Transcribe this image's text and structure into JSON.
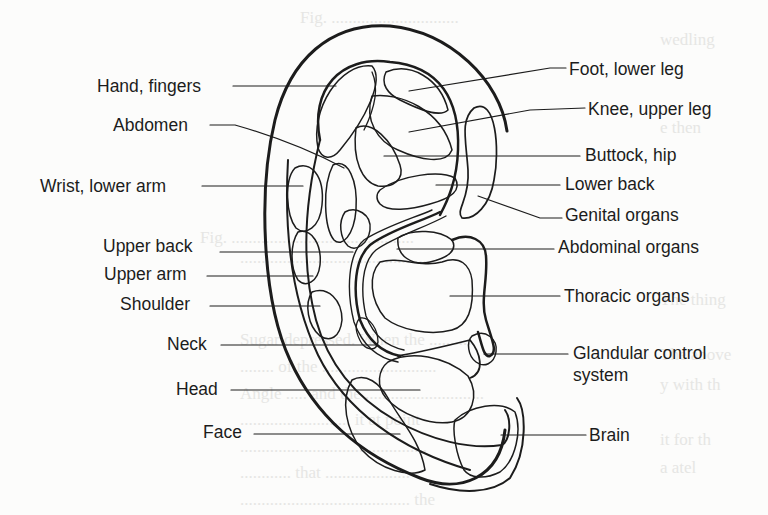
{
  "figure": {
    "type": "auricular-map"
  },
  "labels_left": [
    {
      "id": "hand-fingers",
      "text": "Hand, fingers",
      "x": 97,
      "y": 77
    },
    {
      "id": "abdomen",
      "text": "Abdomen",
      "x": 113,
      "y": 115
    },
    {
      "id": "wrist-lower-arm",
      "text": "Wrist, lower arm",
      "x": 40,
      "y": 176
    },
    {
      "id": "upper-back",
      "text": "Upper back",
      "x": 103,
      "y": 236
    },
    {
      "id": "upper-arm",
      "text": "Upper arm",
      "x": 104,
      "y": 264
    },
    {
      "id": "shoulder",
      "text": "Shoulder",
      "x": 120,
      "y": 294
    },
    {
      "id": "neck",
      "text": "Neck",
      "x": 167,
      "y": 334
    },
    {
      "id": "head",
      "text": "Head",
      "x": 176,
      "y": 379
    },
    {
      "id": "face",
      "text": "Face",
      "x": 203,
      "y": 422
    }
  ],
  "labels_right": [
    {
      "id": "foot-lower-leg",
      "text": "Foot, lower leg",
      "x": 569,
      "y": 59
    },
    {
      "id": "knee-upper-leg",
      "text": "Knee, upper leg",
      "x": 588,
      "y": 99
    },
    {
      "id": "buttock-hip",
      "text": "Buttock, hip",
      "x": 585,
      "y": 145
    },
    {
      "id": "lower-back",
      "text": "Lower back",
      "x": 565,
      "y": 174
    },
    {
      "id": "genital-organs",
      "text": "Genital organs",
      "x": 565,
      "y": 205
    },
    {
      "id": "abdominal-organs",
      "text": "Abdominal organs",
      "x": 558,
      "y": 237
    },
    {
      "id": "thoracic-organs",
      "text": "Thoracic organs",
      "x": 564,
      "y": 286
    },
    {
      "id": "glandular-control-system",
      "text": "Glandular control",
      "text2": "system",
      "x": 573,
      "y": 343
    },
    {
      "id": "brain",
      "text": "Brain",
      "x": 589,
      "y": 425
    }
  ],
  "colors": {
    "ink": "#1c1c1c",
    "paper": "#fcfcfb",
    "show_through": "#e6e6e4"
  }
}
